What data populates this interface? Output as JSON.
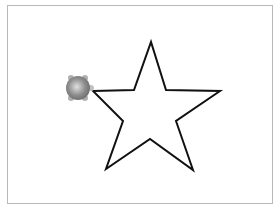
{
  "canvas": {
    "background": "#ffffff",
    "border_color": "#b8b8b8"
  },
  "drawing": {
    "shape": "star",
    "stroke_color": "#111111",
    "stroke_width": 2,
    "points": "93,91 134,90 151,42 166,90 220,91 176,121 193,170 150,139 106,169 123,121"
  },
  "turtle": {
    "x": 78,
    "y": 88,
    "radius": 10,
    "body_color": "#888888",
    "highlight_color": "#d8d8d8"
  }
}
